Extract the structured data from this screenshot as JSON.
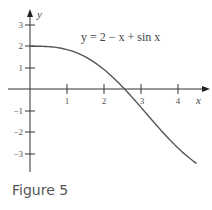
{
  "figure": {
    "caption": "Figure 5"
  },
  "chart_data": {
    "type": "line",
    "title": "",
    "annotation": "y = 2 − x + sin x",
    "xlabel": "x",
    "ylabel": "y",
    "xlim": [
      -0.8,
      4.8
    ],
    "ylim": [
      -3.6,
      3.5
    ],
    "x_ticks": [
      1,
      2,
      3,
      4
    ],
    "y_ticks": [
      3,
      2,
      1,
      -1,
      -2,
      -3
    ],
    "grid": false,
    "series": [
      {
        "name": "y = 2 − x + sin x",
        "x": [
          0,
          0.5,
          1,
          1.5,
          2,
          2.5,
          3,
          3.5,
          4,
          4.5
        ],
        "values": [
          2,
          1.98,
          1.84,
          1.5,
          0.91,
          0.1,
          -0.86,
          -1.85,
          -2.76,
          -3.48
        ]
      }
    ]
  }
}
